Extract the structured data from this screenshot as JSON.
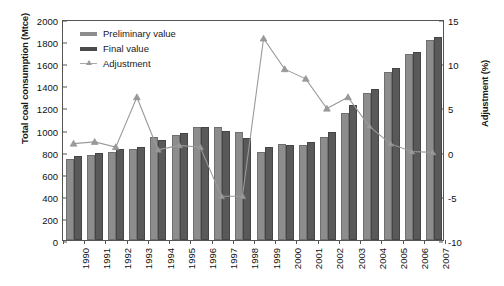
{
  "chart_data": {
    "type": "bar",
    "title": "",
    "xlabel": "",
    "ylabel": "Total coal consumption (Mtce)",
    "ylabel_right": "Adjustment (%)",
    "ylim": [
      0,
      2000
    ],
    "ytick_step": 200,
    "ylim_right": [
      -10,
      15
    ],
    "ytick_step_right": 5,
    "grid": false,
    "legend_position": "top-left",
    "categories": [
      "1990",
      "1991",
      "1992",
      "1993",
      "1994",
      "1995",
      "1996",
      "1997",
      "1998",
      "1999",
      "2000",
      "2001",
      "2002",
      "2003",
      "2004",
      "2005",
      "2006",
      "2007"
    ],
    "yticks": [
      "0",
      "200",
      "400",
      "600",
      "800",
      "1000",
      "1200",
      "1400",
      "1600",
      "1800",
      "2000"
    ],
    "yticks_right": [
      "-10",
      "-5",
      "0",
      "5",
      "10",
      "15"
    ],
    "series": [
      {
        "name": "Preliminary value",
        "color": "#8d8d8d",
        "values": [
          730,
          770,
          800,
          820,
          930,
          950,
          1020,
          1020,
          980,
          800,
          870,
          860,
          930,
          1150,
          1330,
          1520,
          1680,
          1810
        ]
      },
      {
        "name": "Final value",
        "color": "#595959",
        "values": [
          760,
          790,
          825,
          845,
          905,
          970,
          1020,
          985,
          920,
          840,
          860,
          890,
          980,
          1220,
          1370,
          1560,
          1700,
          1835
        ]
      },
      {
        "name": "Adjustment",
        "color": "#9a9a9a",
        "type": "line",
        "axis": "right",
        "values": [
          1.0,
          1.2,
          0.6,
          6.3,
          0.3,
          0.8,
          0.6,
          -5.0,
          -5.0,
          13.0,
          9.5,
          8.4,
          5.0,
          6.3,
          3.0,
          1.0,
          0.1,
          0.0
        ]
      }
    ]
  },
  "legend": {
    "items": [
      {
        "label": "Preliminary value"
      },
      {
        "label": "Final value"
      },
      {
        "label": "Adjustment"
      }
    ]
  }
}
